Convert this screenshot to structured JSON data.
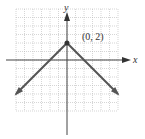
{
  "chart_data": {
    "type": "line",
    "title": "",
    "xlabel": "x",
    "ylabel": "y",
    "xlim": [
      -6,
      6
    ],
    "ylim": [
      -6,
      6
    ],
    "grid": true,
    "legend": null,
    "series": [
      {
        "name": "f(x) = -|x| + 2",
        "points": [
          [
            -6,
            -4
          ],
          [
            0,
            2
          ],
          [
            6,
            -4
          ]
        ],
        "arrows": [
          "start",
          "end"
        ]
      }
    ],
    "annotations": [
      {
        "label": "(0, 2)",
        "x": 0,
        "y": 2,
        "marker": "dot"
      }
    ]
  },
  "labels": {
    "x_axis": "x",
    "y_axis": "y",
    "vertex": "(0, 2)"
  },
  "colors": {
    "line": "#555555",
    "axis": "#444444",
    "grid_major": "#bbbbbb",
    "grid_minor": "#dddddd"
  }
}
